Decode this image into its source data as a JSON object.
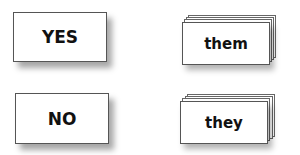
{
  "cards": {
    "yes": {
      "label": "YES",
      "type": "single"
    },
    "no": {
      "label": "NO",
      "type": "single"
    },
    "them": {
      "label": "them",
      "type": "stacked"
    },
    "they": {
      "label": "they",
      "type": "stacked"
    }
  }
}
